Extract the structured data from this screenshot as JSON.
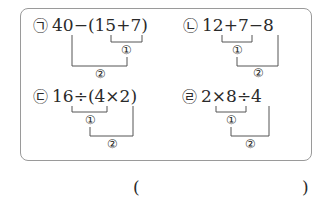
{
  "problems": [
    {
      "symbol": "㉠",
      "expression": "40−(15+7)",
      "step1": "①",
      "step2": "②"
    },
    {
      "symbol": "㉡",
      "expression": "12+7−8",
      "step1": "①",
      "step2": "②"
    },
    {
      "symbol": "㉢",
      "expression": "16÷(4×2)",
      "step1": "①",
      "step2": "②"
    },
    {
      "symbol": "㉣",
      "expression": "2×8÷4",
      "step1": "①",
      "step2": "②"
    }
  ],
  "answer": {
    "open": "(",
    "close": ")",
    "value": ""
  },
  "colors": {
    "text": "#2a2a2a",
    "border": "#9a9a9a",
    "lines": "#555555"
  }
}
